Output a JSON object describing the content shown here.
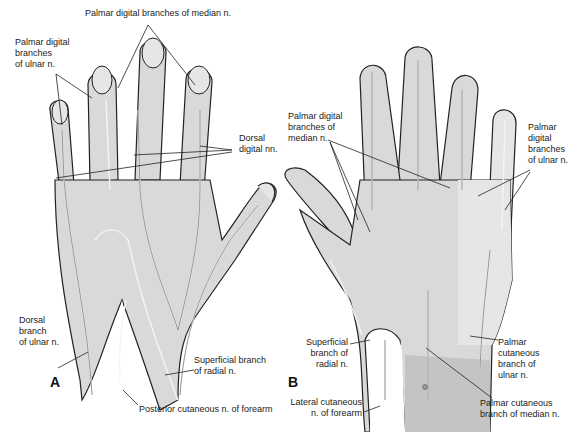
{
  "colors": {
    "skin": "#d9d9d9",
    "skin_light": "#e6e6e6",
    "skin_dark": "#c4c4c4",
    "outline": "#222222",
    "nerve": "#f4f4f4",
    "leader": "#222222",
    "background": "#ffffff"
  },
  "panel_a": {
    "letter": "A",
    "labels": {
      "palmar_median": "Palmar digital branches of median n.",
      "palmar_ulnar": "Palmar digital\nbranches\nof ulnar n.",
      "dorsal_digital": "Dorsal\ndigital nn.",
      "dorsal_ulnar": "Dorsal\nbranch\nof ulnar n.",
      "superficial_radial": "Superficial branch\nof radial n.",
      "posterior_cutaneous": "Posterior cutaneous n. of forearm"
    }
  },
  "panel_b": {
    "letter": "B",
    "labels": {
      "palmar_median": "Palmar digital\nbranches of\nmedian n.",
      "palmar_ulnar": "Palmar\ndigital\nbranches\nof ulnar n.",
      "superficial_radial": "Superficial\nbranch of\nradial n.",
      "lateral_cutaneous": "Lateral cutaneous\nn. of forearm",
      "palmar_cutaneous_ulnar": "Palmar\ncutaneous\nbranch of\nulnar n.",
      "palmar_cutaneous_median": "Palmar cutaneous\nbranch of median n."
    }
  }
}
